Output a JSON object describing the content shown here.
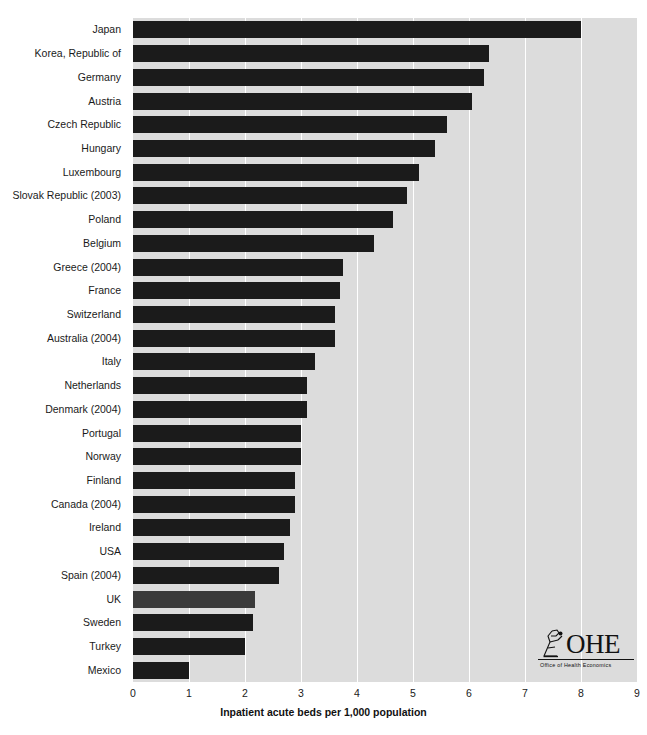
{
  "chart_data": {
    "type": "bar",
    "orientation": "horizontal",
    "title": "",
    "xlabel": "Inpatient acute beds per 1,000 population",
    "ylabel": "",
    "xlim": [
      0,
      9
    ],
    "xticks": [
      0,
      1,
      2,
      3,
      4,
      5,
      6,
      7,
      8,
      9
    ],
    "grid": true,
    "legend": false,
    "categories": [
      "Japan",
      "Korea, Republic of",
      "Germany",
      "Austria",
      "Czech Republic",
      "Hungary",
      "Luxembourg",
      "Slovak Republic (2003)",
      "Poland",
      "Belgium",
      "Greece (2004)",
      "France",
      "Switzerland",
      "Australia (2004)",
      "Italy",
      "Netherlands",
      "Denmark (2004)",
      "Portugal",
      "Norway",
      "Finland",
      "Canada (2004)",
      "Ireland",
      "USA",
      "Spain (2004)",
      "UK",
      "Sweden",
      "Turkey",
      "Mexico"
    ],
    "values": [
      8.0,
      6.35,
      6.27,
      6.05,
      5.6,
      5.4,
      5.1,
      4.9,
      4.65,
      4.3,
      3.75,
      3.7,
      3.6,
      3.6,
      3.25,
      3.1,
      3.1,
      3.0,
      3.0,
      2.9,
      2.9,
      2.8,
      2.7,
      2.6,
      2.18,
      2.14,
      2.0,
      1.0
    ],
    "highlight_category": "UK",
    "bar_color": "#1b1b1b",
    "highlight_color": "#3a3a3a",
    "plot_background": "#dcdcdc",
    "gridline_color": "#ffffff"
  },
  "branding": {
    "logo_name": "ohe-logo",
    "letters": "OHE",
    "subtitle": "Office of Health Economics"
  }
}
